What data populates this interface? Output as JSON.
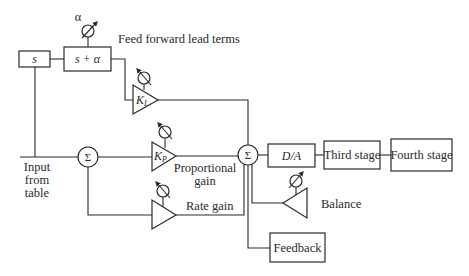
{
  "diagram": {
    "labels": {
      "alpha": "α",
      "feed_forward": "Feed forward lead terms",
      "input_line1": "Input",
      "input_line2": "from",
      "input_line3": "table",
      "proportional_line1": "Proportional",
      "proportional_line2": "gain",
      "rate_gain": "Rate gain",
      "balance": "Balance"
    },
    "blocks": {
      "s": "s",
      "s_plus_alpha": "s + α",
      "da": "D/A",
      "third_stage": "Third stage",
      "fourth_stage": "Fourth stage",
      "feedback": "Feedback"
    },
    "amplifiers": {
      "kl_main": "K",
      "kl_sub": "L",
      "kp_main": "K",
      "kp_sub": "P"
    },
    "summing": {
      "sum1": "Σ",
      "sum2": "Σ"
    },
    "colors": {
      "stroke": "#2a2a2a",
      "background": "#ffffff"
    }
  }
}
